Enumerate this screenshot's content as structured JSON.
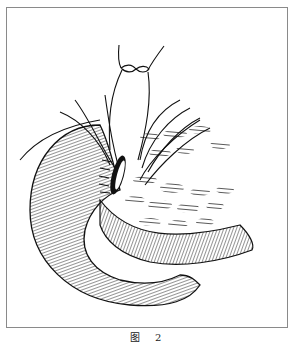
{
  "figure": {
    "caption": "图 2",
    "colors": {
      "frame": "#8a8a8a",
      "ink": "#111111",
      "background": "#ffffff"
    }
  }
}
